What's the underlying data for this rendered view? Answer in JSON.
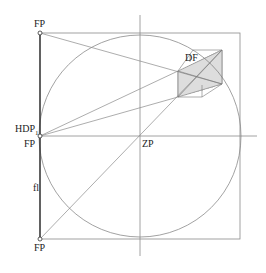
{
  "diagram": {
    "colors": {
      "background": "#ffffff",
      "line": "#8a8a8a",
      "thick_line": "#333333",
      "hatch": "#777777",
      "text": "#222222"
    },
    "labels": {
      "fp_top": "FP",
      "hdp": "HDP",
      "hdp_sub": "1",
      "fp_mid": "FP",
      "fp_bottom": "FP",
      "zp": "ZP",
      "df": "DF",
      "fl": "fl"
    },
    "geometry": {
      "square": {
        "x": 40,
        "y": 33,
        "w": 200,
        "h": 206
      },
      "circle": {
        "cx": 140,
        "cy": 136,
        "r": 101
      },
      "center": {
        "x": 140,
        "y": 136
      }
    }
  }
}
